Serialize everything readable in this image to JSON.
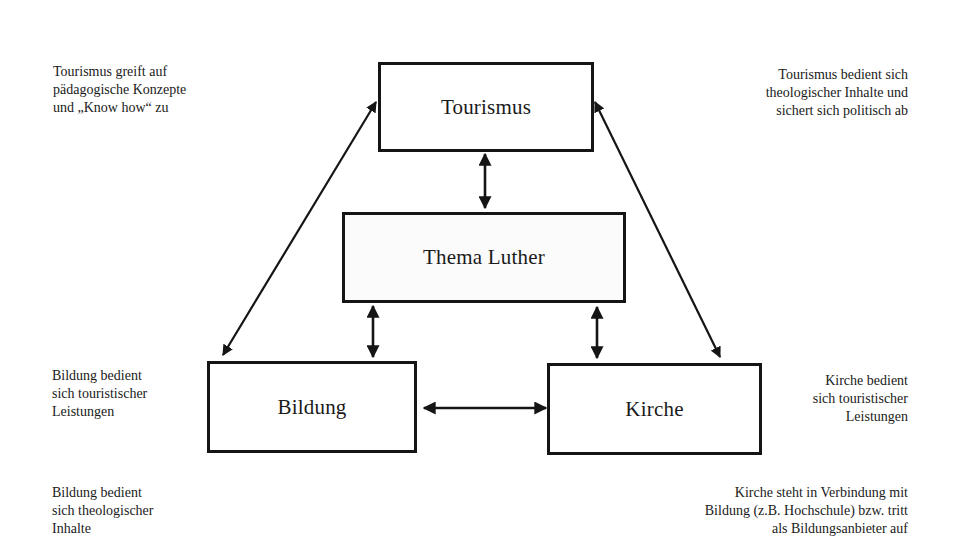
{
  "diagram": {
    "nodes": {
      "tourismus": {
        "label": "Tourismus"
      },
      "luther": {
        "label": "Thema Luther"
      },
      "bildung": {
        "label": "Bildung"
      },
      "kirche": {
        "label": "Kirche"
      }
    },
    "edges": [
      {
        "from": "tourismus",
        "to": "bildung",
        "type": "bidirectional"
      },
      {
        "from": "tourismus",
        "to": "kirche",
        "type": "bidirectional"
      },
      {
        "from": "tourismus",
        "to": "luther",
        "type": "bidirectional"
      },
      {
        "from": "luther",
        "to": "bildung",
        "type": "bidirectional"
      },
      {
        "from": "luther",
        "to": "kirche",
        "type": "bidirectional"
      },
      {
        "from": "bildung",
        "to": "kirche",
        "type": "bidirectional"
      }
    ],
    "annotations": {
      "top_left": "Tourismus greift auf\npädagogische Konzepte\nund „Know how“ zu",
      "top_right": "Tourismus bedient sich\ntheologischer Inhalte und\nsichert sich politisch ab",
      "mid_left": "Bildung bedient\nsich touristischer\nLeistungen",
      "mid_right": "Kirche bedient\nsich touristischer\nLeistungen",
      "bottom_left": "Bildung bedient\nsich theologischer\nInhalte",
      "bottom_right": "Kirche steht in Verbindung mit\nBildung (z.B. Hochschule) bzw. tritt\nals Bildungsanbieter auf"
    },
    "colors": {
      "stroke": "#151515",
      "text": "#1a1a1a",
      "background": "#ffffff"
    }
  }
}
